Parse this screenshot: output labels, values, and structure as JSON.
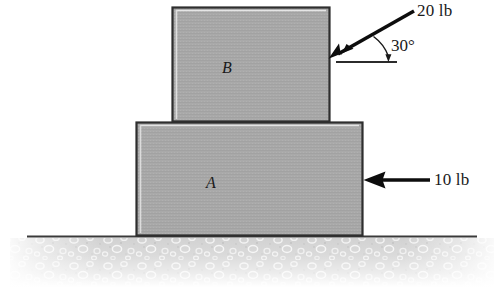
{
  "diagram": {
    "blocks": [
      {
        "id": "block-b",
        "label": "B",
        "x": 172,
        "y": 7,
        "width": 158,
        "height": 113,
        "fill": "#a8a8a8",
        "border": "#333333"
      },
      {
        "id": "block-a",
        "label": "A",
        "x": 136,
        "y": 122,
        "width": 227,
        "height": 114,
        "fill": "#a8a8a8",
        "border": "#333333"
      }
    ],
    "forces": [
      {
        "id": "force-20lb",
        "label": "20 lb",
        "magnitude": 20,
        "units": "lb",
        "angle_deg": 30,
        "direction": "down-left",
        "applied_to": "B",
        "tip_x": 329,
        "tip_y": 58,
        "tail_x": 415,
        "tail_y": 10,
        "color": "#000000"
      },
      {
        "id": "force-10lb",
        "label": "10 lb",
        "magnitude": 10,
        "units": "lb",
        "angle_deg": 180,
        "direction": "left",
        "applied_to": "A",
        "tip_x": 363,
        "tip_y": 180,
        "tail_x": 430,
        "tail_y": 180,
        "color": "#000000"
      }
    ],
    "angle_marker": {
      "id": "angle-30",
      "label": "30°",
      "value": 30,
      "units": "degrees",
      "vertex_x": 336,
      "vertex_y": 62,
      "reference_line_x1": 336,
      "reference_line_x2": 397,
      "reference_line_y": 62
    },
    "ground": {
      "id": "ground",
      "line_y": 236,
      "line_x1": 27,
      "line_x2": 477,
      "fill_top": "#d8d8d8",
      "fill_bottom": "#f4f4f4",
      "texture": "speckled-gravel"
    }
  },
  "labels": {
    "force_20lb": "20 lb",
    "force_10lb": "10 lb",
    "angle_30": "30°",
    "block_b": "B",
    "block_a": "A"
  }
}
